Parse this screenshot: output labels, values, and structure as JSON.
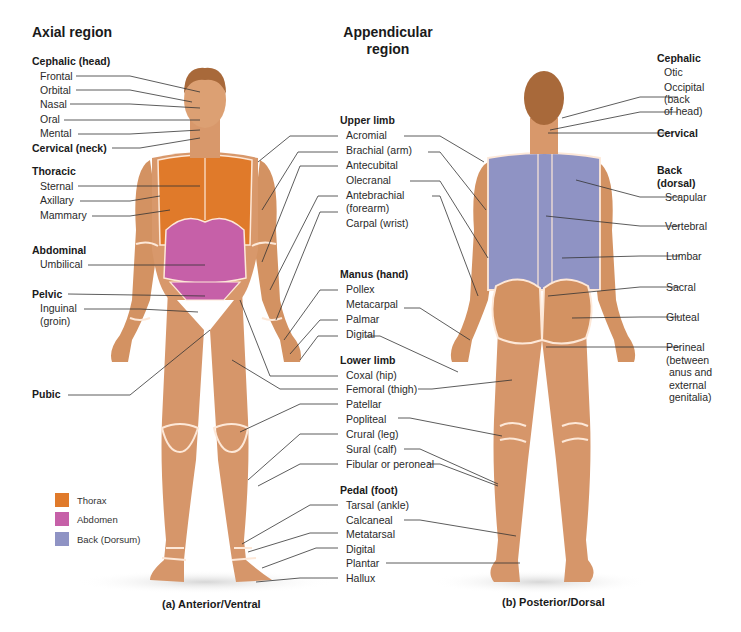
{
  "headings": {
    "axial": "Axial region",
    "appendicular_line1": "Appendicular",
    "appendicular_line2": "region"
  },
  "captions": {
    "anterior": "(a) Anterior/Ventral",
    "posterior": "(b) Posterior/Dorsal"
  },
  "axial": {
    "cephalic_head": "Cephalic (head)",
    "frontal": "Frontal",
    "orbital": "Orbital",
    "nasal": "Nasal",
    "oral": "Oral",
    "mental": "Mental",
    "cervical_neck": "Cervical (neck)",
    "thoracic": "Thoracic",
    "sternal": "Sternal",
    "axillary": "Axillary",
    "mammary": "Mammary",
    "abdominal": "Abdominal",
    "umbilical": "Umbilical",
    "pelvic": "Pelvic",
    "inguinal_1": "Inguinal",
    "inguinal_2": "(groin)",
    "pubic": "Pubic"
  },
  "appendicular": {
    "upper_limb": "Upper limb",
    "acromial": "Acromial",
    "brachial": "Brachial (arm)",
    "antecubital": "Antecubital",
    "olecranal": "Olecranal",
    "antebrachial_1": "Antebrachial",
    "antebrachial_2": "(forearm)",
    "carpal": "Carpal (wrist)",
    "manus": "Manus (hand)",
    "pollex": "Pollex",
    "metacarpal": "Metacarpal",
    "palmar": "Palmar",
    "digital_hand": "Digital",
    "lower_limb": "Lower limb",
    "coxal": "Coxal (hip)",
    "femoral": "Femoral (thigh)",
    "patellar": "Patellar",
    "popliteal": "Popliteal",
    "crural": "Crural (leg)",
    "sural": "Sural (calf)",
    "fibular": "Fibular or peroneal",
    "pedal": "Pedal (foot)",
    "tarsal": "Tarsal (ankle)",
    "calcaneal": "Calcaneal",
    "metatarsal": "Metatarsal",
    "digital_foot": "Digital",
    "plantar": "Plantar",
    "hallux": "Hallux"
  },
  "posterior": {
    "cephalic": "Cephalic",
    "otic": "Otic",
    "occipital_1": "Occipital",
    "occipital_2": "(back",
    "occipital_3": "of head)",
    "cervical": "Cervical",
    "back_1": "Back",
    "back_2": "(dorsal)",
    "scapular": "Scapular",
    "vertebral": "Vertebral",
    "lumbar": "Lumbar",
    "sacral": "Sacral",
    "gluteal": "Gluteal",
    "perineal_1": "Perineal",
    "perineal_2": "(between",
    "perineal_3": "anus and",
    "perineal_4": "external",
    "perineal_5": "genitalia)"
  },
  "legend": {
    "items": [
      {
        "label": "Thorax",
        "color": "#e07a2a"
      },
      {
        "label": "Abdomen",
        "color": "#c660a8"
      },
      {
        "label": "Back (Dorsum)",
        "color": "#8f93c4"
      }
    ]
  },
  "colors": {
    "skin": "#d9996a",
    "skin_dark": "#c98457",
    "hair": "#a8693a",
    "outline": "#fde8d8",
    "leader": "#333333",
    "thorax": "#e07a2a",
    "abdomen": "#c660a8",
    "back": "#8f93c4"
  }
}
